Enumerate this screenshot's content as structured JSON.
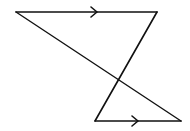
{
  "diagram": {
    "type": "geometry-parallel-lines-transversal",
    "stroke_color": "#111111",
    "background": "#ffffff",
    "vertices": {
      "top_left": [
        16,
        12
      ],
      "top_right": [
        157,
        12
      ],
      "bottom_left": [
        95,
        121
      ],
      "bottom_right": [
        181,
        121
      ]
    },
    "segments": [
      {
        "name": "top-parallel",
        "from": "top_left",
        "to": "top_right",
        "arrow_at_x": 97
      },
      {
        "name": "bottom-parallel",
        "from": "bottom_left",
        "to": "bottom_right",
        "arrow_at_x": 138
      },
      {
        "name": "transversal-1",
        "from": "top_left",
        "to": "bottom_right"
      },
      {
        "name": "transversal-2",
        "from": "top_right",
        "to": "bottom_left"
      }
    ],
    "parallel_marker": "single-arrow"
  }
}
